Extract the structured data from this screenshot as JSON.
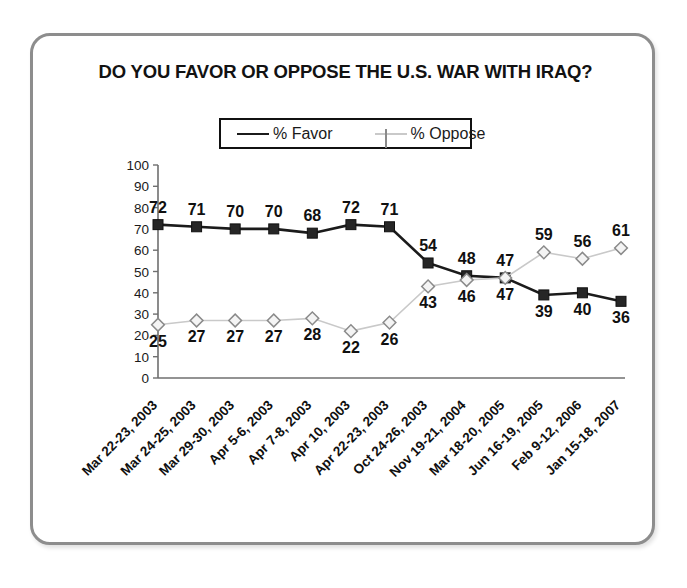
{
  "chart_data": {
    "type": "line",
    "title": "DO YOU FAVOR OR OPPOSE THE U.S. WAR WITH IRAQ?",
    "xlabel": "",
    "ylabel": "",
    "ylim": [
      0,
      100
    ],
    "ytick_step": 10,
    "yticks": [
      "100",
      "90",
      "80",
      "70",
      "60",
      "50",
      "40",
      "30",
      "20",
      "10",
      "0"
    ],
    "grid": false,
    "legend_position": "top-center",
    "categories": [
      "Mar 22-23, 2003",
      "Mar 24-25, 2003",
      "Mar 29-30, 2003",
      "Apr 5-6, 2003",
      "Apr 7-8, 2003",
      "Apr 10, 2003",
      "Apr 22-23, 2003",
      "Oct 24-26, 2003",
      "Nov 19-21, 2004",
      "Mar 18-20, 2005",
      "Jun 16-19, 2005",
      "Feb 9-12, 2006",
      "Jan 15-18, 2007"
    ],
    "series": [
      {
        "name": "% Favor",
        "color": "#1b1b1b",
        "marker": "square",
        "values": [
          72,
          71,
          70,
          70,
          68,
          72,
          71,
          54,
          48,
          47,
          39,
          40,
          36
        ],
        "label_offsets": [
          -1,
          -1,
          -1,
          -1,
          -1,
          -1,
          -1,
          -1,
          -1,
          -1,
          1,
          1,
          1
        ]
      },
      {
        "name": "% Oppose",
        "color": "#c9c9c9",
        "marker": "diamond",
        "values": [
          25,
          27,
          27,
          27,
          28,
          22,
          26,
          43,
          46,
          47,
          59,
          56,
          61
        ],
        "label_offsets": [
          1,
          1,
          1,
          1,
          1,
          1,
          1,
          1,
          1,
          1,
          -1,
          -1,
          -1
        ]
      }
    ]
  },
  "legend": {
    "favor_label": "% Favor",
    "oppose_label": "% Oppose"
  }
}
